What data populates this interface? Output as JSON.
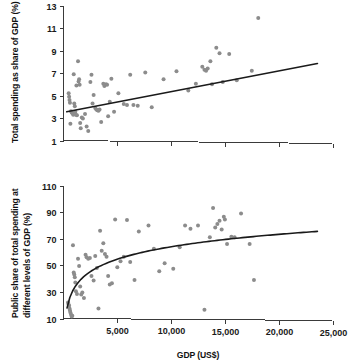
{
  "figure": {
    "background": "#ffffff",
    "point_color": "#8c8c8c",
    "line_color": "#1a1a1a",
    "axis_color": "#3a3a3a"
  },
  "chart_data": [
    {
      "id": "top",
      "type": "scatter",
      "title": "",
      "xlabel": "",
      "ylabel": "Total spending as share of GDP (%)",
      "xlim": [
        0,
        25000
      ],
      "ylim": [
        1,
        13
      ],
      "grid": false,
      "legend": null,
      "xticks": [
        5000,
        10000,
        15000,
        20000,
        25000
      ],
      "xticklabels": [
        "",
        "",
        "",
        "",
        ""
      ],
      "yticks": [
        1,
        3,
        5,
        7,
        9,
        11,
        13
      ],
      "yticklabels": [
        "1",
        "3",
        "5",
        "7",
        "9",
        "11",
        "13"
      ],
      "points": [
        [
          480,
          5.2
        ],
        [
          520,
          4.9
        ],
        [
          560,
          4.6
        ],
        [
          600,
          4.35
        ],
        [
          640,
          2.5
        ],
        [
          700,
          3.6
        ],
        [
          760,
          3.5
        ],
        [
          820,
          3.45
        ],
        [
          860,
          3.4
        ],
        [
          900,
          3.3
        ],
        [
          950,
          6.9
        ],
        [
          1000,
          4.3
        ],
        [
          1050,
          4.05
        ],
        [
          1100,
          3.55
        ],
        [
          1150,
          3.3
        ],
        [
          1200,
          5.9
        ],
        [
          1250,
          3.25
        ],
        [
          1350,
          8.05
        ],
        [
          1400,
          6.25
        ],
        [
          1450,
          6.45
        ],
        [
          1500,
          5.95
        ],
        [
          1550,
          2.55
        ],
        [
          1600,
          2.1
        ],
        [
          1700,
          3.05
        ],
        [
          1800,
          2.95
        ],
        [
          2000,
          3.35
        ],
        [
          2150,
          2.25
        ],
        [
          2300,
          1.85
        ],
        [
          2500,
          6.2
        ],
        [
          2600,
          6.85
        ],
        [
          2700,
          4.3
        ],
        [
          2800,
          5.05
        ],
        [
          2950,
          3.9
        ],
        [
          3050,
          3.75
        ],
        [
          3150,
          3.7
        ],
        [
          3250,
          3.65
        ],
        [
          3350,
          3.75
        ],
        [
          3500,
          2.65
        ],
        [
          3700,
          6.05
        ],
        [
          3800,
          5.85
        ],
        [
          3950,
          6.0
        ],
        [
          4050,
          5.95
        ],
        [
          4150,
          3.15
        ],
        [
          4300,
          4.45
        ],
        [
          4450,
          6.5
        ],
        [
          4700,
          3.55
        ],
        [
          5100,
          5.2
        ],
        [
          5600,
          4.25
        ],
        [
          5900,
          4.15
        ],
        [
          6200,
          6.85
        ],
        [
          6500,
          4.15
        ],
        [
          6900,
          4.1
        ],
        [
          7600,
          7.05
        ],
        [
          8200,
          3.95
        ],
        [
          9300,
          6.45
        ],
        [
          10500,
          7.15
        ],
        [
          11600,
          5.45
        ],
        [
          12300,
          6.05
        ],
        [
          12900,
          7.55
        ],
        [
          13100,
          7.3
        ],
        [
          13250,
          7.2
        ],
        [
          13400,
          7.4
        ],
        [
          13650,
          8.05
        ],
        [
          13800,
          6.0
        ],
        [
          14200,
          9.25
        ],
        [
          14500,
          8.75
        ],
        [
          14800,
          6.2
        ],
        [
          15400,
          8.7
        ],
        [
          16100,
          6.35
        ],
        [
          17500,
          7.2
        ],
        [
          18100,
          11.9
        ]
      ],
      "fit": {
        "type": "linear",
        "x0": 300,
        "y0": 3.55,
        "x1": 23600,
        "y1": 7.85
      }
    },
    {
      "id": "bottom",
      "type": "scatter",
      "title": "",
      "xlabel": "GDP (US$)",
      "ylabel": "Public share of total spending at different levels of GDP (%)",
      "ylabel_line1": "Public share of total spending at",
      "ylabel_line2": "different levels of GDP (%)",
      "xlim": [
        0,
        25000
      ],
      "ylim": [
        10,
        110
      ],
      "grid": false,
      "legend": null,
      "xticks": [
        5000,
        10000,
        15000,
        20000,
        25000
      ],
      "xticklabels": [
        "5,000",
        "10,000",
        "15,000",
        "20,000",
        "25,000"
      ],
      "yticks": [
        10,
        30,
        50,
        70,
        90,
        110
      ],
      "yticklabels": [
        "10",
        "30",
        "50",
        "70",
        "90",
        "110"
      ],
      "points": [
        [
          420,
          22.0
        ],
        [
          470,
          20.5
        ],
        [
          520,
          19.5
        ],
        [
          560,
          17.5
        ],
        [
          600,
          16.0
        ],
        [
          640,
          14.5
        ],
        [
          700,
          13.0
        ],
        [
          760,
          11.5
        ],
        [
          820,
          12.0
        ],
        [
          880,
          65.0
        ],
        [
          950,
          44.5
        ],
        [
          1000,
          43.0
        ],
        [
          1050,
          41.0
        ],
        [
          1100,
          37.0
        ],
        [
          1150,
          30.5
        ],
        [
          1250,
          28.5
        ],
        [
          1350,
          55.0
        ],
        [
          1450,
          49.5
        ],
        [
          1550,
          34.0
        ],
        [
          1650,
          28.0
        ],
        [
          1750,
          29.5
        ],
        [
          1900,
          25.5
        ],
        [
          2050,
          58.0
        ],
        [
          2150,
          56.0
        ],
        [
          2300,
          55.0
        ],
        [
          2450,
          55.5
        ],
        [
          2600,
          42.0
        ],
        [
          2800,
          38.5
        ],
        [
          2950,
          57.0
        ],
        [
          3100,
          48.0
        ],
        [
          3250,
          17.5
        ],
        [
          3400,
          76.0
        ],
        [
          3550,
          61.0
        ],
        [
          3700,
          66.5
        ],
        [
          3850,
          58.5
        ],
        [
          4000,
          56.5
        ],
        [
          4150,
          42.0
        ],
        [
          4300,
          35.5
        ],
        [
          4500,
          36.5
        ],
        [
          4800,
          84.5
        ],
        [
          5000,
          48.5
        ],
        [
          5300,
          53.0
        ],
        [
          5600,
          56.5
        ],
        [
          5900,
          84.0
        ],
        [
          6200,
          52.5
        ],
        [
          6600,
          39.0
        ],
        [
          7000,
          75.5
        ],
        [
          7900,
          80.0
        ],
        [
          8400,
          62.5
        ],
        [
          8900,
          45.5
        ],
        [
          9400,
          51.5
        ],
        [
          10200,
          47.5
        ],
        [
          10800,
          63.5
        ],
        [
          11300,
          80.0
        ],
        [
          11800,
          77.5
        ],
        [
          12500,
          80.0
        ],
        [
          13100,
          16.5
        ],
        [
          13600,
          71.0
        ],
        [
          13900,
          93.0
        ],
        [
          14100,
          78.5
        ],
        [
          14300,
          81.0
        ],
        [
          14500,
          83.5
        ],
        [
          14700,
          77.0
        ],
        [
          14900,
          86.5
        ],
        [
          15000,
          84.5
        ],
        [
          15200,
          66.0
        ],
        [
          15600,
          71.5
        ],
        [
          15900,
          71.0
        ],
        [
          16500,
          89.0
        ],
        [
          17300,
          66.0
        ],
        [
          17700,
          39.0
        ]
      ],
      "fit": {
        "type": "log",
        "x0": 330,
        "y0": 18.0,
        "x1": 23600,
        "y1": 75.5
      }
    }
  ]
}
